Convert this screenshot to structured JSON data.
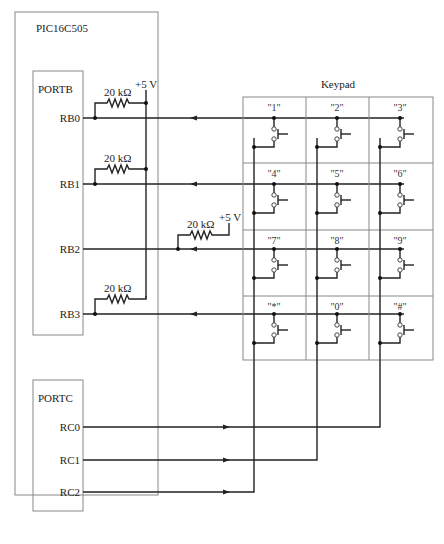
{
  "diagram": {
    "chip_label": "PIC16C505",
    "portb": {
      "label": "PORTB",
      "pins": [
        "RB0",
        "RB1",
        "RB2",
        "RB3"
      ]
    },
    "portc": {
      "label": "PORTC",
      "pins": [
        "RC0",
        "RC1",
        "RC2"
      ]
    },
    "resistors": [
      {
        "value": "20 kΩ",
        "pin": "RB0"
      },
      {
        "value": "20 kΩ",
        "pin": "RB1"
      },
      {
        "value": "20 kΩ",
        "pin": "RB2"
      },
      {
        "value": "20 kΩ",
        "pin": "RB3"
      }
    ],
    "supply_labels": [
      "+5 V",
      "+5 V"
    ],
    "keypad": {
      "title": "Keypad",
      "keys": [
        [
          "\"1\"",
          "\"2\"",
          "\"3\""
        ],
        [
          "\"4\"",
          "\"5\"",
          "\"6\""
        ],
        [
          "\"7\"",
          "\"8\"",
          "\"9\""
        ],
        [
          "\"*\"",
          "\"0\"",
          "\"#\""
        ]
      ]
    },
    "wire_color": "#222222",
    "box_color": "#888888"
  }
}
